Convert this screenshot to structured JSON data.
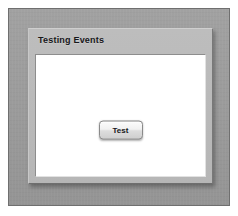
{
  "window": {
    "title": "Testing Events"
  },
  "panel": {
    "title": "Testing Events",
    "titlebar_name": "panel-titlebar"
  },
  "content": {
    "button": {
      "label": "Test"
    }
  },
  "colors": {
    "page_background": "#ffffff",
    "frame_background": "#9a9a9a",
    "frame_border": "#6f6f6f",
    "panel_background": "#b9b9b9",
    "panel_border_light": "#cfcfcf",
    "panel_border_dark": "#6e6e6e",
    "content_background": "#ffffff",
    "title_text": "#17171a",
    "button_face": "#e8e8e8",
    "button_border": "#8a8a8a",
    "button_text": "#16161a"
  }
}
